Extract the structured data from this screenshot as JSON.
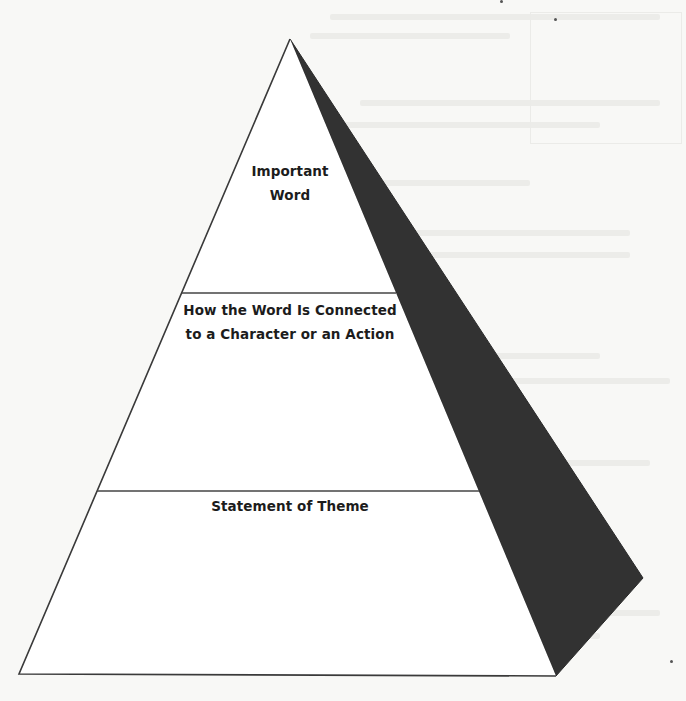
{
  "diagram": {
    "type": "pyramid-organizer",
    "levels": [
      {
        "id": "top",
        "lines": [
          "Important",
          "Word"
        ]
      },
      {
        "id": "middle",
        "lines": [
          "How the Word Is Connected",
          "to a Character or an Action"
        ]
      },
      {
        "id": "bottom",
        "lines": [
          "Statement of Theme"
        ]
      }
    ],
    "colors": {
      "outline": "#3a3a3a",
      "shaded_face": "#323232",
      "front_face": "#ffffff",
      "label_text": "#1c1c1c",
      "page_background": "#f8f8f6"
    },
    "geometry": {
      "apex": [
        290,
        39
      ],
      "front_base_left": [
        19,
        674
      ],
      "front_base_right": [
        556,
        676
      ],
      "side_back_corner": [
        643,
        578
      ],
      "divider_1_y": 293,
      "divider_2_y": 491
    }
  }
}
